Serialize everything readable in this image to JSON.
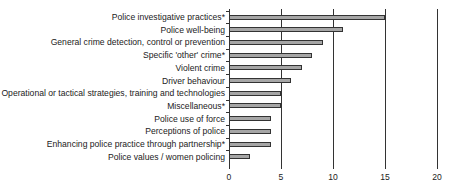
{
  "chart_data": {
    "type": "bar",
    "orientation": "horizontal",
    "title": "",
    "xlabel": "",
    "ylabel": "",
    "categories": [
      "Police investigative practices*",
      "Police well-being",
      "General crime detection, control or prevention",
      "Specific 'other' crime*",
      "Violent crime",
      "Driver behaviour",
      "Operational or tactical strategies, training and technologies",
      "Miscellaneous*",
      "Police use of force",
      "Perceptions of police",
      "Enhancing police practice through partnership*",
      "Police values / women policing"
    ],
    "values": [
      15,
      11,
      9,
      8,
      7,
      6,
      5,
      5,
      4,
      4,
      4,
      2
    ],
    "xlim": [
      0,
      20
    ],
    "xticks": [
      "0",
      "5",
      "10",
      "15",
      "20"
    ],
    "grid": "vertical",
    "legend": null,
    "bar_color": "#a6a6a6",
    "bar_edge_color": "#333333"
  }
}
